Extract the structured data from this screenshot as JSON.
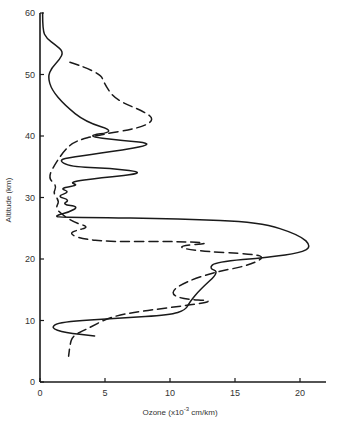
{
  "chart_data": {
    "type": "line",
    "title": "",
    "xlabel": "Ozone (x10^-3 cm/km)",
    "xlabel_parts": {
      "prefix": "Ozone  (x10",
      "sup": "-3",
      "suffix": " cm/km)"
    },
    "ylabel": "Altitude (km)",
    "xlim": [
      0,
      22
    ],
    "ylim": [
      0,
      60
    ],
    "xticks": [
      0,
      5,
      10,
      15,
      20
    ],
    "yticks": [
      0,
      10,
      20,
      30,
      40,
      50,
      60
    ],
    "grid": false,
    "legend": null,
    "series": [
      {
        "name": "solid profile",
        "style": "solid",
        "color": "#1a1a1a",
        "points": [
          [
            0.2,
            60
          ],
          [
            0.2,
            57.2
          ],
          [
            0.5,
            55.9
          ],
          [
            1.2,
            54.8
          ],
          [
            1.8,
            53.7
          ],
          [
            1.5,
            52.4
          ],
          [
            0.9,
            51.1
          ],
          [
            0.6,
            49.6
          ],
          [
            0.9,
            47.5
          ],
          [
            1.9,
            45
          ],
          [
            3.5,
            42.3
          ],
          [
            5.9,
            40.7
          ],
          [
            3.4,
            40.0
          ],
          [
            6.2,
            39.3
          ],
          [
            9.0,
            38.7
          ],
          [
            5.4,
            37.4
          ],
          [
            2.5,
            36.6
          ],
          [
            1.4,
            36.1
          ],
          [
            2.3,
            35.0
          ],
          [
            5.4,
            34.8
          ],
          [
            8.3,
            34.0
          ],
          [
            4.6,
            33.2
          ],
          [
            2.2,
            32.5
          ],
          [
            3.0,
            32.0
          ],
          [
            1.5,
            31.5
          ],
          [
            2.3,
            30.9
          ],
          [
            1.3,
            30.2
          ],
          [
            2.3,
            29.6
          ],
          [
            1.7,
            28.9
          ],
          [
            3.0,
            28.5
          ],
          [
            2.2,
            27.6
          ],
          [
            1.4,
            27.2
          ],
          [
            1.2,
            26.8
          ],
          [
            3.1,
            26.8
          ],
          [
            10.8,
            26.5
          ],
          [
            16.9,
            26.0
          ],
          [
            20.0,
            23.9
          ],
          [
            20.9,
            22.0
          ],
          [
            20.0,
            21.0
          ],
          [
            17.7,
            20.3
          ],
          [
            13.5,
            19.5
          ],
          [
            13.0,
            18.5
          ],
          [
            13.8,
            17.9
          ],
          [
            12.3,
            15.0
          ],
          [
            11.5,
            13.0
          ],
          [
            11.2,
            11.7
          ],
          [
            10.0,
            10.9
          ],
          [
            6.2,
            10.4
          ],
          [
            1.5,
            9.8
          ],
          [
            0.8,
            8.8
          ],
          [
            1.9,
            8.0
          ],
          [
            4.2,
            7.5
          ]
        ]
      },
      {
        "name": "dashed profile",
        "style": "dashed",
        "color": "#1a1a1a",
        "points": [
          [
            2.3,
            52.0
          ],
          [
            4.6,
            50.4
          ],
          [
            5.0,
            48.3
          ],
          [
            5.8,
            45.9
          ],
          [
            8.1,
            43.9
          ],
          [
            8.8,
            42.6
          ],
          [
            7.7,
            41.3
          ],
          [
            4.6,
            40.2
          ],
          [
            2.7,
            39.2
          ],
          [
            1.9,
            37.7
          ],
          [
            1.2,
            35.6
          ],
          [
            0.6,
            33.2
          ],
          [
            1.3,
            31.9
          ],
          [
            1.0,
            30.7
          ],
          [
            1.5,
            29.4
          ],
          [
            1.2,
            28.3
          ],
          [
            1.7,
            27.2
          ],
          [
            2.7,
            25.9
          ],
          [
            3.8,
            25.2
          ],
          [
            2.7,
            24.6
          ],
          [
            2.3,
            24.1
          ],
          [
            3.1,
            23.3
          ],
          [
            5.4,
            22.8
          ],
          [
            9.6,
            22.9
          ],
          [
            13.5,
            22.6
          ],
          [
            10.4,
            22.1
          ],
          [
            11.9,
            21.3
          ],
          [
            16.5,
            20.8
          ],
          [
            17.3,
            20.2
          ],
          [
            15.8,
            18.8
          ],
          [
            13.5,
            17.9
          ],
          [
            11.2,
            16.3
          ],
          [
            10.0,
            14.6
          ],
          [
            10.8,
            13.5
          ],
          [
            13.5,
            13.2
          ],
          [
            11.5,
            12.5
          ],
          [
            7.7,
            11.5
          ],
          [
            5.4,
            10.6
          ],
          [
            3.5,
            8.5
          ],
          [
            2.5,
            7.5
          ],
          [
            2.3,
            6.0
          ],
          [
            2.2,
            4.2
          ]
        ]
      }
    ]
  },
  "layout": {
    "plot_left": 40,
    "plot_bottom": 382,
    "px_per_x": 13,
    "px_per_y": 6.15,
    "axis_x_end": 326,
    "axis_color": "#1a1a1a"
  }
}
